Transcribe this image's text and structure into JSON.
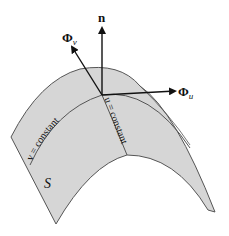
{
  "diagram": {
    "type": "parametric-surface",
    "surface_label": "S",
    "vectors": [
      {
        "name": "normal",
        "label": "n",
        "subscript": ""
      },
      {
        "name": "tangent-v",
        "label": "Φ",
        "subscript": "v"
      },
      {
        "name": "tangent-u",
        "label": "Φ",
        "subscript": "u"
      }
    ],
    "curves": [
      {
        "name": "v-constant",
        "label": "v = constant"
      },
      {
        "name": "u-constant",
        "label": "u = constant"
      }
    ],
    "colors": {
      "surface_fill": "#d6d6d6",
      "outline": "#555555",
      "arrow": "#111111"
    }
  }
}
